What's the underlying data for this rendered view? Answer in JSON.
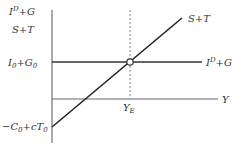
{
  "diagram": {
    "type": "macroeconomic-equilibrium",
    "y_axis_label_line1": "I^D+G",
    "y_axis_label_line2": "S+T",
    "x_axis_label": "Y",
    "curves": [
      {
        "name": "S+T",
        "label": "S+T",
        "style": "solid",
        "slope": "positive"
      },
      {
        "name": "I^D+G",
        "label": "I^D+G",
        "style": "solid",
        "slope": "horizontal"
      }
    ],
    "intercepts": {
      "investment_government": "I0+G0",
      "savings_taxes": "-C0+cT0"
    },
    "equilibrium": {
      "label": "Y_E",
      "marker": "open-circle",
      "guide": "dashed-vertical"
    },
    "colors": {
      "line": "#333333",
      "axis": "#555555",
      "dashed": "#888888",
      "text": "#333333"
    }
  }
}
